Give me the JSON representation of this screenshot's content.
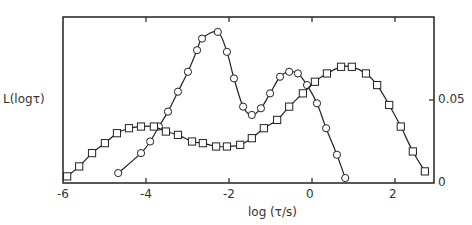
{
  "chart_data": {
    "type": "line",
    "title": "",
    "xlabel": "log (τ/s)",
    "ylabel": "L(logτ)",
    "xlim": [
      -6,
      2.7
    ],
    "ylim": [
      0,
      0.1
    ],
    "x_ticks": [
      "-6",
      "-4",
      "-2",
      "0",
      "2"
    ],
    "x_tick_values": [
      -6,
      -4,
      -2,
      0,
      2
    ],
    "y_ticks": [
      "0",
      "0.05"
    ],
    "y_tick_values": [
      0,
      0.05
    ],
    "y_axis_side": "right",
    "grid": false,
    "legend": null,
    "series": [
      {
        "name": "circles",
        "marker": "circle",
        "points": [
          [
            -4.67,
            0.006
          ],
          [
            -4.12,
            0.018
          ],
          [
            -3.9,
            0.025
          ],
          [
            -3.69,
            0.034
          ],
          [
            -3.47,
            0.043
          ],
          [
            -3.23,
            0.055
          ],
          [
            -2.99,
            0.067
          ],
          [
            -2.77,
            0.08
          ],
          [
            -2.65,
            0.087
          ],
          [
            -2.27,
            0.091
          ],
          [
            -2.05,
            0.079
          ],
          [
            -1.88,
            0.063
          ],
          [
            -1.66,
            0.046
          ],
          [
            -1.45,
            0.041
          ],
          [
            -1.23,
            0.045
          ],
          [
            -1.01,
            0.054
          ],
          [
            -0.77,
            0.064
          ],
          [
            -0.55,
            0.067
          ],
          [
            -0.34,
            0.066
          ],
          [
            -0.12,
            0.059
          ],
          [
            0.12,
            0.048
          ],
          [
            0.34,
            0.033
          ],
          [
            0.6,
            0.017
          ],
          [
            0.8,
            0.003
          ]
        ]
      },
      {
        "name": "squares",
        "marker": "square",
        "points": [
          [
            -5.9,
            0.004
          ],
          [
            -5.61,
            0.01
          ],
          [
            -5.3,
            0.018
          ],
          [
            -4.99,
            0.024
          ],
          [
            -4.7,
            0.03
          ],
          [
            -4.41,
            0.033
          ],
          [
            -4.12,
            0.034
          ],
          [
            -3.81,
            0.034
          ],
          [
            -3.52,
            0.031
          ],
          [
            -3.23,
            0.029
          ],
          [
            -2.89,
            0.025
          ],
          [
            -2.63,
            0.024
          ],
          [
            -2.31,
            0.022
          ],
          [
            -2.05,
            0.022
          ],
          [
            -1.73,
            0.023
          ],
          [
            -1.45,
            0.027
          ],
          [
            -1.16,
            0.033
          ],
          [
            -0.84,
            0.038
          ],
          [
            -0.55,
            0.046
          ],
          [
            -0.22,
            0.054
          ],
          [
            0.07,
            0.061
          ],
          [
            0.36,
            0.066
          ],
          [
            0.7,
            0.07
          ],
          [
            0.96,
            0.07
          ],
          [
            1.3,
            0.066
          ],
          [
            1.57,
            0.059
          ],
          [
            1.86,
            0.047
          ],
          [
            2.14,
            0.034
          ],
          [
            2.43,
            0.019
          ],
          [
            2.72,
            0.007
          ]
        ]
      }
    ]
  }
}
